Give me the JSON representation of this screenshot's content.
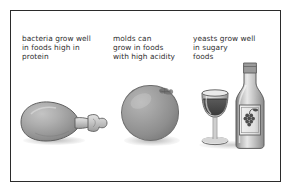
{
  "figure": {
    "type": "educational-diagram",
    "background_color": "#ffffff",
    "border_color": "#2b2b2b",
    "art_style": "grayscale-shaded-illustration",
    "panels": [
      {
        "id": "bacteria",
        "caption": "bacteria grow well\nin foods high in\nprotein",
        "caption_lines": [
          "bacteria grow well",
          "in foods high in",
          "protein"
        ],
        "microbe": "bacteria",
        "food_condition": "foods high in protein",
        "illustration": "chicken-drumstick",
        "illustration_label": "chicken drumstick"
      },
      {
        "id": "molds",
        "caption": "molds can\ngrow in foods\nwith high acidity",
        "caption_lines": [
          "molds can",
          "grow in foods",
          "with high acidity"
        ],
        "microbe": "molds",
        "food_condition": "foods with high acidity",
        "illustration": "orange-fruit",
        "illustration_label": "orange"
      },
      {
        "id": "yeasts",
        "caption": "yeasts grow well\nin sugary\nfoods",
        "caption_lines": [
          "yeasts grow well",
          "in sugary",
          "foods"
        ],
        "microbe": "yeasts",
        "food_condition": "sugary foods",
        "illustration": "wine-bottle-and-glass",
        "illustration_label": "wine bottle with grape label and wine glass"
      }
    ],
    "colors": {
      "text": "#2e2e2e",
      "frame": "#2b2b2b",
      "art_light": "#c9c9c9",
      "art_mid": "#9a9a9a",
      "art_dark": "#6d6d6d",
      "wine_fill": "#4a4a4a"
    }
  }
}
